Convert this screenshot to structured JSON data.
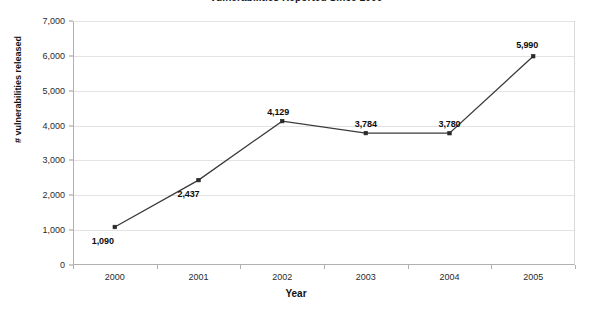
{
  "chart_data": {
    "type": "line",
    "title": "Vulnerabilities Reported Since 2000",
    "xlabel": "Year",
    "ylabel": "# vulnerabilities released",
    "categories": [
      "2000",
      "2001",
      "2002",
      "2003",
      "2004",
      "2005"
    ],
    "values": [
      1090,
      2437,
      4129,
      3784,
      3780,
      5990
    ],
    "point_labels": [
      "1,090",
      "2,437",
      "4,129",
      "3,784",
      "3,780",
      "5,990"
    ],
    "ylim": [
      0,
      7000
    ],
    "ytick_values": [
      0,
      1000,
      2000,
      3000,
      4000,
      5000,
      6000,
      7000
    ],
    "ytick_labels": [
      "0",
      "1,000",
      "2,000",
      "3,000",
      "4,000",
      "5,000",
      "6,000",
      "7,000"
    ],
    "grid": true,
    "legend": false,
    "series_color": "#3a3a3a",
    "gridline_color": "#e3e3e3",
    "axis_color": "#b0b0b0",
    "background_color": "#ffffff"
  }
}
